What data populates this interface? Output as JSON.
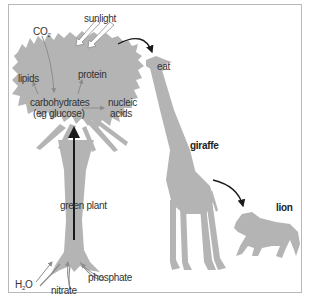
{
  "diagram": {
    "colors": {
      "silhouette": "#b4b4b4",
      "arrow_dark": "#1a1a1a",
      "arrow_grey": "#8c8c8c",
      "frame": "#b8b8b8",
      "text": "#333333"
    },
    "labels": {
      "sunlight": "sunlight",
      "co2_main": "CO",
      "co2_sub": "2",
      "lipids": "lipids",
      "protein": "protein",
      "carbohydrates": "carbohydrates",
      "glucose": "(eg glucose)",
      "nucleic": "nucleic",
      "acids": "acids",
      "eat": "eat",
      "giraffe": "giraffe",
      "lion": "lion",
      "green_plant": "green plant",
      "h2o_h": "H",
      "h2o_sub": "2",
      "h2o_o": "O",
      "nitrate": "nitrate",
      "phosphate": "phosphate"
    },
    "nodes": [
      {
        "id": "sunlight",
        "type": "input"
      },
      {
        "id": "CO2",
        "type": "input"
      },
      {
        "id": "H2O",
        "type": "input"
      },
      {
        "id": "nitrate",
        "type": "input"
      },
      {
        "id": "phosphate",
        "type": "input"
      },
      {
        "id": "carbohydrates (eg glucose)",
        "type": "product"
      },
      {
        "id": "lipids",
        "type": "product"
      },
      {
        "id": "protein",
        "type": "product"
      },
      {
        "id": "nucleic acids",
        "type": "product"
      },
      {
        "id": "green plant",
        "type": "organism"
      },
      {
        "id": "giraffe",
        "type": "organism"
      },
      {
        "id": "lion",
        "type": "organism"
      }
    ],
    "edges": [
      {
        "from": "sunlight",
        "to": "green plant"
      },
      {
        "from": "CO2",
        "to": "carbohydrates (eg glucose)"
      },
      {
        "from": "carbohydrates (eg glucose)",
        "to": "lipids"
      },
      {
        "from": "carbohydrates (eg glucose)",
        "to": "protein"
      },
      {
        "from": "carbohydrates (eg glucose)",
        "to": "nucleic acids"
      },
      {
        "from": "H2O",
        "to": "green plant"
      },
      {
        "from": "nitrate",
        "to": "green plant"
      },
      {
        "from": "phosphate",
        "to": "green plant"
      },
      {
        "from": "green plant",
        "to": "carbohydrates (eg glucose)",
        "label": "transport up trunk"
      },
      {
        "from": "green plant",
        "to": "giraffe",
        "label": "eat"
      },
      {
        "from": "giraffe",
        "to": "lion"
      }
    ]
  }
}
